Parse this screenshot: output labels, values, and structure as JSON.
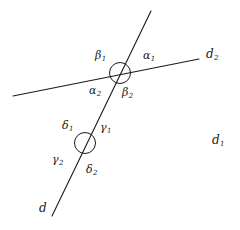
{
  "figure": {
    "background_color": "#ffffff",
    "stroke_color": "#1a1a1a",
    "text_color": "#1a1a1a",
    "width": 240,
    "height": 230
  },
  "lines": [
    {
      "name": "line-d2",
      "label": "d",
      "subscript": "2",
      "x1": 13,
      "y1": 96,
      "x2": 199,
      "y2": 59
    },
    {
      "name": "line-d",
      "label": "d",
      "subscript": "",
      "x1": 52,
      "y1": 216,
      "x2": 151,
      "y2": 11
    }
  ],
  "circles": [
    {
      "name": "upper-intersection-circle",
      "cx": 120,
      "cy": 73,
      "r": 10.5
    },
    {
      "name": "lower-circle",
      "cx": 85,
      "cy": 143,
      "r": 10.5
    }
  ],
  "angle_labels": [
    {
      "name": "beta-1",
      "base": "β",
      "sub": "1",
      "x": 95,
      "y": 50
    },
    {
      "name": "alpha-1",
      "base": "α",
      "sub": "1",
      "x": 143,
      "y": 50
    },
    {
      "name": "alpha-2",
      "base": "α",
      "sub": "2",
      "x": 89,
      "y": 85
    },
    {
      "name": "beta-2",
      "base": "β",
      "sub": "2",
      "x": 122,
      "y": 87
    },
    {
      "name": "delta-1",
      "base": "δ",
      "sub": "1",
      "x": 62,
      "y": 120
    },
    {
      "name": "gamma-1",
      "base": "γ",
      "sub": "1",
      "x": 100,
      "y": 122
    },
    {
      "name": "gamma-2",
      "base": "γ",
      "sub": "2",
      "x": 52,
      "y": 154
    },
    {
      "name": "delta-2",
      "base": "δ",
      "sub": "2",
      "x": 86,
      "y": 164
    }
  ],
  "line_labels": [
    {
      "name": "label-d2",
      "base": "d",
      "sub": "2",
      "x": 206,
      "y": 48
    },
    {
      "name": "label-d1",
      "base": "d",
      "sub": "1",
      "x": 212,
      "y": 134
    },
    {
      "name": "label-d",
      "base": "d",
      "sub": "",
      "x": 39,
      "y": 202
    }
  ]
}
